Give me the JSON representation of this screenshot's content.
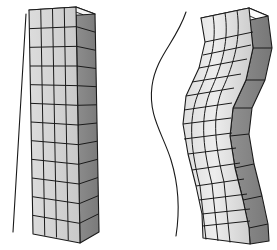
{
  "figure": {
    "background_color": "#ffffff",
    "width": 277,
    "height": 250,
    "panels": [
      {
        "id": "left-panel",
        "name": "undeformed-column",
        "label": "undeformed straight column",
        "reference_line": {
          "name": "straight-reference-line",
          "type": "straight",
          "color": "#1a1a1a",
          "stroke_width": 1.1,
          "x_top": 26,
          "y_top": 14,
          "x_bottom": 13,
          "y_bottom": 232
        },
        "mesh": {
          "front_face_color": "#d6d6d6",
          "front_face_color_light": "#e4e4e4",
          "side_face_color": "#848484",
          "top_face_color": "#f2f2f2",
          "line_color": "#1a1a1a",
          "line_width": 1.0,
          "columns": 4,
          "rows": 12,
          "side_columns": 1,
          "front_top_left": [
            29,
            10
          ],
          "front_top_right": [
            76,
            7
          ],
          "front_bottom_left": [
            33,
            234
          ],
          "front_bottom_right": [
            80,
            243
          ],
          "side_top_right": [
            95,
            14
          ],
          "side_bottom_right": [
            99,
            232
          ]
        }
      },
      {
        "id": "right-panel",
        "name": "deformed-column",
        "label": "deformed buckled column in S-shape",
        "reference_line": {
          "name": "curved-reference-line",
          "type": "s-curve",
          "color": "#1a1a1a",
          "stroke_width": 1.1,
          "path": "M 186,12 C 176,42 156,58 152,86 C 148,116 163,134 171,160 C 179,186 180,208 176,234"
        },
        "mesh": {
          "front_face_color": "#d6d6d6",
          "front_face_color_light": "#f0f0f0",
          "side_face_color": "#7e7e7e",
          "side_face_color_light": "#9a9a9a",
          "top_face_color": "#fbfbfb",
          "line_color": "#1a1a1a",
          "line_width": 1.0,
          "columns": 4,
          "rows": 12,
          "side_columns": 1,
          "deflection_shape": "double-curvature S",
          "front_top_left": [
            201,
            18
          ],
          "front_top_right": [
            249,
            8
          ],
          "front_bottom_left": [
            203,
            238
          ],
          "front_bottom_right": [
            250,
            244
          ]
        }
      }
    ]
  }
}
